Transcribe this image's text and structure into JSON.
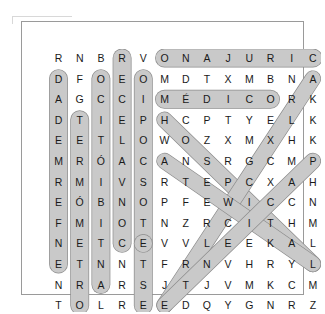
{
  "puzzle": {
    "kind": "word-search",
    "language": "es",
    "rows": 13,
    "cols": 13,
    "grid": [
      [
        "R",
        "N",
        "B",
        "R",
        "V",
        "O",
        "N",
        "A",
        "J",
        "U",
        "R",
        "I",
        "C"
      ],
      [
        "D",
        "F",
        "O",
        "E",
        "O",
        "M",
        "D",
        "T",
        "X",
        "M",
        "B",
        "N",
        "A"
      ],
      [
        "A",
        "G",
        "C",
        "C",
        "I",
        "M",
        "É",
        "D",
        "I",
        "C",
        "O",
        "R",
        "K"
      ],
      [
        "D",
        "T",
        "I",
        "E",
        "P",
        "H",
        "C",
        "P",
        "T",
        "Y",
        "E",
        "L",
        "K"
      ],
      [
        "E",
        "E",
        "T",
        "L",
        "O",
        "W",
        "O",
        "Z",
        "X",
        "M",
        "X",
        "H",
        "K"
      ],
      [
        "M",
        "R",
        "Ó",
        "A",
        "C",
        "A",
        "N",
        "S",
        "R",
        "G",
        "C",
        "M",
        "P"
      ],
      [
        "R",
        "M",
        "I",
        "V",
        "S",
        "R",
        "T",
        "E",
        "P",
        "C",
        "X",
        "A",
        "H"
      ],
      [
        "E",
        "Ó",
        "B",
        "N",
        "O",
        "P",
        "F",
        "E",
        "W",
        "I",
        "C",
        "C",
        "N"
      ],
      [
        "F",
        "M",
        "I",
        "O",
        "T",
        "N",
        "Z",
        "R",
        "C",
        "I",
        "T",
        "H",
        "M"
      ],
      [
        "N",
        "E",
        "T",
        "C",
        "E",
        "V",
        "V",
        "L",
        "E",
        "E",
        "K",
        "A",
        "L"
      ],
      [
        "E",
        "T",
        "N",
        "N",
        "T",
        "F",
        "R",
        "N",
        "V",
        "H",
        "R",
        "Y",
        "L"
      ],
      [
        "N",
        "R",
        "A",
        "R",
        "S",
        "J",
        "T",
        "J",
        "V",
        "M",
        "K",
        "C",
        "M"
      ],
      [
        "T",
        "O",
        "L",
        "R",
        "E",
        "E",
        "D",
        "Q",
        "Y",
        "G",
        "N",
        "R",
        "Z"
      ]
    ],
    "highlight_color": "#c9c9c9",
    "highlight_stroke": "#8c8c8c",
    "found_words": [
      {
        "name": "cirujano",
        "text": "ONAJURIC",
        "direction": "horizontal-reversed",
        "start": {
          "row": 0,
          "col": 5
        },
        "end": {
          "row": 0,
          "col": 12
        },
        "reads": "CIRUJANO"
      },
      {
        "name": "medico",
        "text": "MÉDICO",
        "direction": "horizontal",
        "start": {
          "row": 2,
          "col": 5
        },
        "end": {
          "row": 2,
          "col": 10
        },
        "reads": "MÉDICO"
      },
      {
        "name": "enfermedad",
        "text": "DADEMREFNE",
        "direction": "vertical-reversed",
        "start": {
          "row": 1,
          "col": 0
        },
        "end": {
          "row": 10,
          "col": 0
        },
        "reads": "ENFERMEDAD"
      },
      {
        "name": "termometro",
        "text": "TERMÓMETRO",
        "direction": "vertical",
        "start": {
          "row": 3,
          "col": 1
        },
        "end": {
          "row": 12,
          "col": 1
        },
        "reads": "TERMÓMETRO"
      },
      {
        "name": "antibiotico",
        "text": "OCITÓIBITNA",
        "direction": "vertical-reversed",
        "start": {
          "row": 1,
          "col": 2
        },
        "end": {
          "row": 11,
          "col": 2
        },
        "reads": "ANTIBIÓTICO"
      },
      {
        "name": "convalecer",
        "text": "RECELAVNOC",
        "direction": "vertical-reversed",
        "start": {
          "row": 0,
          "col": 3
        },
        "end": {
          "row": 9,
          "col": 3
        },
        "reads": "RECELAVNOC"
      },
      {
        "name": "estetoscopio",
        "text": "OIPOCSOTETSE",
        "direction": "vertical-reversed",
        "start": {
          "row": 1,
          "col": 4
        },
        "end": {
          "row": 12,
          "col": 4
        },
        "reads": "ESTETOSCOPIO"
      },
      {
        "name": "diagonal-down-right-from-h",
        "text": "HOSEEITEE",
        "direction": "diagonal-down-right",
        "start": {
          "row": 3,
          "col": 5
        },
        "end": {
          "row": 9,
          "col": 9
        },
        "reads": "diagonal"
      },
      {
        "name": "diagonal-down-left-from-a",
        "text": "ATFZVNTE",
        "direction": "diagonal-down-left",
        "start": {
          "row": 5,
          "col": 5
        },
        "end": {
          "row": 12,
          "col": 5
        },
        "reads": "diagonal"
      },
      {
        "name": "diagonal-down-left-from-a-right",
        "text": "AREMSEECR",
        "direction": "diagonal-down-left-long",
        "start": {
          "row": 1,
          "col": 12
        },
        "end": {
          "row": 10,
          "col": 10
        },
        "reads": "diagonal"
      },
      {
        "name": "diagonal-down-left-from-p",
        "text": "PACTKL",
        "direction": "diagonal-down-left-short",
        "start": {
          "row": 5,
          "col": 12
        },
        "end": {
          "row": 10,
          "col": 12
        },
        "reads": "diagonal"
      },
      {
        "name": "diagonal-down-right-from-e",
        "text": "EVLEEKA",
        "direction": "diagonal-bottom",
        "start": {
          "row": 9,
          "col": 4
        },
        "end": {
          "row": 12,
          "col": 5
        },
        "reads": "diagonal"
      }
    ]
  }
}
